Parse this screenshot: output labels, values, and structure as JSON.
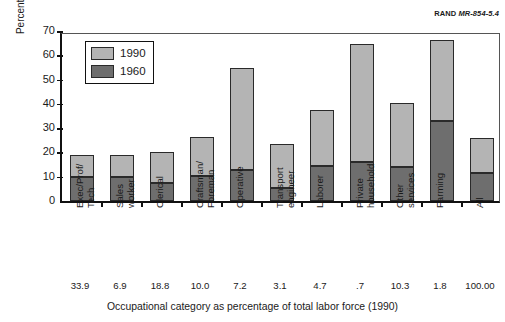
{
  "credit": {
    "org": "RAND",
    "number": "MR-854-5.4"
  },
  "chart_data": {
    "type": "bar",
    "stacked": true,
    "title": "",
    "xlabel": "Occupational category as percentage of total labor force (1990)",
    "ylabel": "Percent immigrants",
    "ylim": [
      0,
      70
    ],
    "yticks": [
      0,
      10,
      20,
      30,
      40,
      50,
      60,
      70
    ],
    "grid": false,
    "legend_position": "upper-left",
    "categories": [
      "Exec/Prof/\nTech",
      "Sales\nworker",
      "Clerical",
      "Craftsman/\nForeman",
      "Operative",
      "Transport\nengineer",
      "Laborer",
      "Private\nhousehold",
      "Other\nservices",
      "Farming",
      "All"
    ],
    "series": [
      {
        "name": "1960",
        "color": "#6e6e6e",
        "values": [
          9.7,
          9.9,
          7.5,
          10.3,
          12.6,
          5.4,
          14.6,
          16.0,
          14.1,
          33.0,
          11.6
        ]
      },
      {
        "name": "1990",
        "color": "#b4b4b4",
        "values": [
          19.0,
          19.1,
          20.2,
          26.2,
          54.6,
          23.5,
          37.3,
          64.5,
          40.3,
          66.5,
          25.9
        ]
      }
    ],
    "secondary_axis_label": "Occupational category as percentage of total labor force (1990)",
    "secondary_values": [
      "33.9",
      "6.9",
      "18.8",
      "10.0",
      "7.2",
      "3.1",
      "4.7",
      ".7",
      "10.3",
      "1.8",
      "100.00"
    ]
  }
}
